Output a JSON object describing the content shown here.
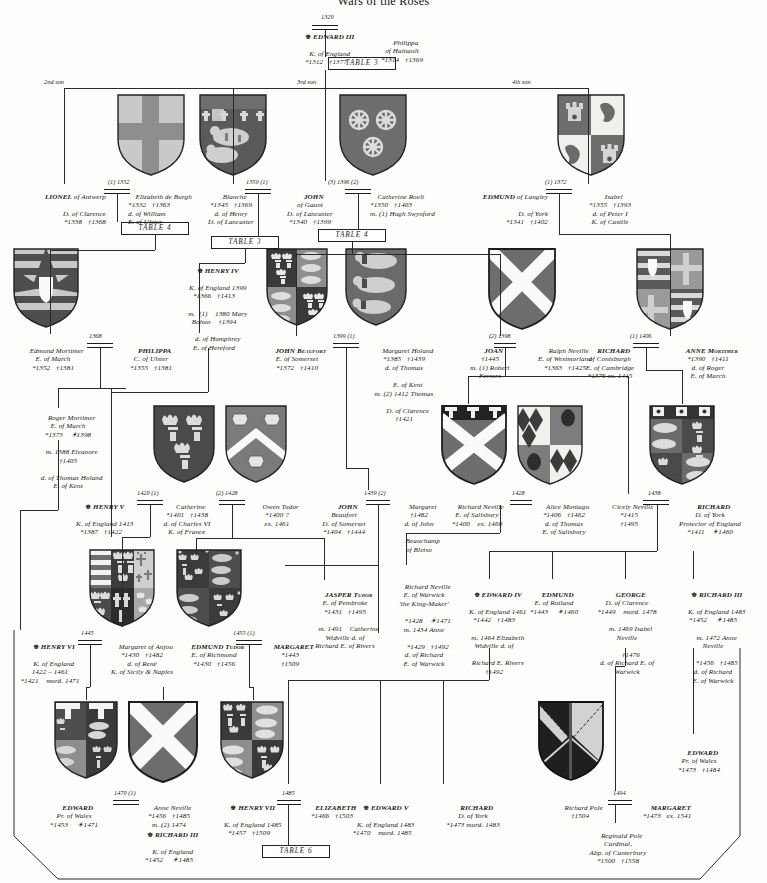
{
  "title": "Wars of the Roses",
  "generation_labels": [
    {
      "id": "second-son",
      "label": "2nd son"
    },
    {
      "id": "third-son",
      "label": "3rd son"
    },
    {
      "id": "fourth-son",
      "label": "4th son"
    }
  ],
  "table_refs": [
    {
      "id": "table-3-top",
      "label": "TABLE 3"
    },
    {
      "id": "table-4-lionel",
      "label": "TABLE 4"
    },
    {
      "id": "table-3-blanche",
      "label": "TABLE 3"
    },
    {
      "id": "table-4-gaunt",
      "label": "TABLE 4"
    },
    {
      "id": "table-6-bottom",
      "label": "TABLE 6"
    }
  ],
  "marriage_labels": [
    {
      "id": "m-edward3",
      "label": "1329"
    },
    {
      "id": "m-lionel",
      "label": "(1) 1352"
    },
    {
      "id": "m-blanche-gaunt",
      "label": "1359 (1)"
    },
    {
      "id": "m-gaunt-roelt",
      "label": "(3) 1396 (2)"
    },
    {
      "id": "m-edmund-isabel",
      "label": "(1) 1372"
    },
    {
      "id": "m-mortimer-philippa",
      "label": "1368"
    },
    {
      "id": "m-beaufort-holand",
      "label": "1399 (1)"
    },
    {
      "id": "m-joan-neville",
      "label": "(2) 1398"
    },
    {
      "id": "m-richard-anne",
      "label": "(1) 1406"
    },
    {
      "id": "m-henry5-catherine",
      "label": "1420 (1)"
    },
    {
      "id": "m-catherine-owen",
      "label": "(2) 1428"
    },
    {
      "id": "m-john-margaret",
      "label": "1439 (2)"
    },
    {
      "id": "m-neville-montagu",
      "label": "1428"
    },
    {
      "id": "m-cicely-richard",
      "label": "1438"
    },
    {
      "id": "m-henry6-margaret",
      "label": "1445"
    },
    {
      "id": "m-edmund-margaret",
      "label": "1455 (1)"
    },
    {
      "id": "m-edward-anne",
      "label": "1470 (1)"
    },
    {
      "id": "m-henry7-elizabeth",
      "label": "1485"
    },
    {
      "id": "m-pole-margaret",
      "label": "1494"
    }
  ],
  "people": [
    {
      "id": "edward-iii",
      "crown": true,
      "name": "EDWARD III",
      "lines": [
        "K. of England",
        "*1312   †1377"
      ]
    },
    {
      "id": "philippa-hainault",
      "crown": false,
      "name": "Philippa",
      "lines": [
        "of Hainault",
        "*1314   †1369"
      ]
    },
    {
      "id": "lionel-antwerp",
      "crown": false,
      "name": "LIONEL",
      "name_suffix": " of Antwerp",
      "lines": [
        "D. of Clarence",
        "*1338   †1368"
      ]
    },
    {
      "id": "elizabeth-de-burgh",
      "crown": false,
      "name": "Elizabeth de Burgh",
      "lines": [
        "*1332   †1363",
        "d. of William",
        "E. of Ulster"
      ]
    },
    {
      "id": "blanche",
      "crown": false,
      "name": "Blanche",
      "lines": [
        "*1345   †1369",
        "d. of Henry",
        "D. of Lancaster"
      ]
    },
    {
      "id": "john-gaunt",
      "crown": false,
      "name": "JOHN",
      "lines": [
        "of Gaunt",
        "D. of Lancaster",
        "*1340   †1399"
      ]
    },
    {
      "id": "catherine-roelt",
      "crown": false,
      "name": "Catherine Roelt",
      "lines": [
        "*1350   †1403",
        "m. (1) Hugh Swynford"
      ]
    },
    {
      "id": "edmund-langley",
      "crown": false,
      "name": "EDMUND",
      "name_suffix": " of Langley",
      "lines": [
        "D. of York",
        "*1341   †1402"
      ]
    },
    {
      "id": "isabel-castile",
      "crown": false,
      "name": "Isabel",
      "lines": [
        "*1355   †1393",
        "d. of Peter I",
        "K. of Castile"
      ]
    },
    {
      "id": "edmund-mortimer",
      "crown": false,
      "name": "Edmund Mortimer",
      "lines": [
        "E. of March",
        "*1352   †1381"
      ]
    },
    {
      "id": "philippa-ulster",
      "crown": false,
      "name": "PHILIPPA",
      "lines": [
        "C. of Ulster",
        "*1355   †1381"
      ]
    },
    {
      "id": "henry-iv",
      "crown": true,
      "name": "HENRY IV",
      "lines": [
        "K. of England 1399",
        "*1366   †1413",
        "m.  (1)    1380 Mary",
        "Bohun    †1394",
        "d. of Humphrey",
        "E. of Hereford"
      ]
    },
    {
      "id": "john-beaufort",
      "crown": false,
      "name": "JOHN Beaufort",
      "lines": [
        "E. of Somerset",
        "*1372   †1410"
      ]
    },
    {
      "id": "margaret-holand",
      "crown": false,
      "name": "Margaret Holand",
      "lines": [
        "*1385   †1439",
        "d. of Thomas",
        "E. of Kent",
        "m. (2) 1412 Thomas",
        "D. of Clarence",
        "†1421"
      ]
    },
    {
      "id": "joan",
      "crown": false,
      "name": "JOAN",
      "lines": [
        "†1445",
        "m. (1) Robert",
        "Ferrers"
      ]
    },
    {
      "id": "ralph-neville",
      "crown": false,
      "name": "Ralph Neville",
      "lines": [
        "E. of Westmorland",
        "*1363   †1425"
      ]
    },
    {
      "id": "richard-conisburgh",
      "crown": false,
      "name": "RICHARD",
      "lines": [
        "of Conisburgh",
        "E. of Cambridge",
        "*1376 ex. 1415"
      ]
    },
    {
      "id": "anne-mortimer",
      "crown": false,
      "name": "ANNE Mortimer",
      "lines": [
        "*1390   †1411",
        "d. of Roger",
        "E. of March"
      ]
    },
    {
      "id": "roger-mortimer",
      "crown": false,
      "name": "Roger Mortimer",
      "lines": [
        "E. of March",
        "*1373    ☀1398",
        "m. 1388 Eleanore",
        "†1405",
        "d. of Thomas Holand",
        "E. of Kent"
      ]
    },
    {
      "id": "henry-v",
      "crown": true,
      "name": "HENRY V",
      "lines": [
        "K. of England 1413",
        "*1387   †1422"
      ]
    },
    {
      "id": "catherine-valois",
      "crown": false,
      "name": "Catherine",
      "lines": [
        "*1401   †1438",
        "d. of Charles VI",
        "K. of France"
      ]
    },
    {
      "id": "owen-tudor",
      "crown": false,
      "name": "Owen Tudor",
      "lines": [
        "*1400 ?",
        "ex. 1461"
      ]
    },
    {
      "id": "john-beaufort-2",
      "crown": false,
      "name": "JOHN",
      "lines": [
        "Beaufort",
        "D. of Somerset",
        "*1404   †1444"
      ]
    },
    {
      "id": "margaret-beauchamp",
      "crown": false,
      "name": "Margaret",
      "lines": [
        "†1482",
        "d. of John",
        "Beauchamp",
        "of Bletso"
      ]
    },
    {
      "id": "richard-neville-salisbury",
      "crown": false,
      "name": "Richard Neville",
      "lines": [
        "E. of Salisbury",
        "*1400    ex. 1460"
      ]
    },
    {
      "id": "alice-montagu",
      "crown": false,
      "name": "Alice Montagu",
      "lines": [
        "*1406   †1462",
        "d. of Thomas",
        "E. of Salisbury"
      ]
    },
    {
      "id": "cicely-neville",
      "crown": false,
      "name": "Cicely Neville",
      "lines": [
        "*1415",
        "†1495"
      ]
    },
    {
      "id": "richard-york",
      "crown": false,
      "name": "RICHARD",
      "lines": [
        "D. of York",
        "Protector of England",
        "*1411    ☀1460"
      ]
    },
    {
      "id": "jasper-tudor",
      "crown": false,
      "name": "JASPER Tudor",
      "lines": [
        "E. of Pembroke",
        "*1431   †1495",
        "m. 1491    Catherine",
        "Widville d. of",
        "Richard E. of Rivers"
      ]
    },
    {
      "id": "richard-neville-warwick",
      "crown": false,
      "name": "Richard Neville",
      "lines": [
        "E. of Warwick",
        "'the King-Maker'",
        "*1428    ☀1471",
        "m. 1434 Anne",
        "*1429   †1492",
        "d. of Richard",
        "E. of Warwick"
      ]
    },
    {
      "id": "edward-iv",
      "crown": true,
      "name": "EDWARD IV",
      "lines": [
        "K. of England 1461",
        "*1442   †1483",
        "m. 1464 Elizabeth",
        "Widville d. of",
        "Richard E. Rivers",
        "†1492"
      ]
    },
    {
      "id": "edmund-rutland",
      "crown": false,
      "name": "EDMUND",
      "lines": [
        "E. of Rutland",
        "*1443     ☀1460"
      ]
    },
    {
      "id": "george-clarence",
      "crown": false,
      "name": "GEORGE",
      "lines": [
        "D. of Clarence",
        "*1449    murd. 1478",
        "m. 1469 Isabel",
        "Neville",
        "†1476",
        "d. of Richard E. of",
        "Warwick"
      ]
    },
    {
      "id": "richard-iii-top",
      "crown": true,
      "name": "RICHARD III",
      "lines": [
        "K. of England 1483",
        "*1452     ☀1485",
        "m. 1472 Anne",
        "Neville",
        "*1456   †1485",
        "d. of Richard",
        "E. of Warwick"
      ]
    },
    {
      "id": "henry-vi",
      "crown": true,
      "name": "HENRY VI",
      "lines": [
        "K. of England",
        "1422 – 1461",
        "*1421    murd. 1471"
      ]
    },
    {
      "id": "margaret-anjou",
      "crown": false,
      "name": "Margaret of Anjou",
      "lines": [
        "*1430   †1482",
        "d. of René",
        "K. of Sicily & Naples"
      ]
    },
    {
      "id": "edmund-tudor",
      "crown": false,
      "name": "EDMUND Tudor",
      "lines": [
        "E. of Richmond",
        "*1430   †1456"
      ]
    },
    {
      "id": "margaret-beaufort",
      "crown": false,
      "name": "MARGARET",
      "lines": [
        "*1443",
        "†1509"
      ]
    },
    {
      "id": "edward-pr-wales-1471",
      "crown": false,
      "name": "EDWARD",
      "lines": [
        "Pr. of Wales",
        "*1453     ☀1471"
      ]
    },
    {
      "id": "anne-neville",
      "crown": false,
      "name": "Anne Neville",
      "lines": [
        "*1456   †1485",
        "m. (2) 1474"
      ]
    },
    {
      "id": "richard-iii-bottom",
      "crown": true,
      "name": "RICHARD III",
      "lines": [
        "K. of England",
        "*1452     ☀1485"
      ]
    },
    {
      "id": "henry-vii",
      "crown": true,
      "name": "HENRY VII",
      "lines": [
        "K. of England 1485",
        "*1457   †1509"
      ]
    },
    {
      "id": "elizabeth-york",
      "crown": false,
      "name": "ELIZABETH",
      "lines": [
        "*1466   †1503"
      ]
    },
    {
      "id": "edward-v",
      "crown": true,
      "name": "EDWARD V",
      "lines": [
        "K. of England 1483",
        "*1470    murd. 1485"
      ]
    },
    {
      "id": "richard-york-duke",
      "crown": false,
      "name": "RICHARD",
      "lines": [
        "D. of York",
        "*1473 murd. 1483"
      ]
    },
    {
      "id": "edward-pr-wales-1484",
      "crown": false,
      "name": "EDWARD",
      "lines": [
        "Pr. of Wales",
        "*1473   †1484"
      ]
    },
    {
      "id": "richard-pole",
      "crown": false,
      "name": "Richard Pole",
      "lines": [
        "†1504"
      ]
    },
    {
      "id": "margaret-pole",
      "crown": false,
      "name": "MARGARET",
      "lines": [
        "*1473   ex. 1541"
      ]
    },
    {
      "id": "reginald-pole",
      "crown": false,
      "name": "Reginald Pole",
      "lines": [
        "Cardinal,",
        "Abp. of Canterbury",
        "*1500   †1558"
      ]
    }
  ],
  "shields": [
    {
      "id": "shield-lionel-clarence",
      "blazon": "clarence-cross"
    },
    {
      "id": "shield-blanche-lancaster",
      "blazon": "lancaster-lions"
    },
    {
      "id": "shield-john-gaunt",
      "blazon": "roelt-wheels"
    },
    {
      "id": "shield-isabel-castile",
      "blazon": "castile-leon"
    },
    {
      "id": "shield-edmund-mortimer",
      "blazon": "mortimer-bars"
    },
    {
      "id": "shield-john-beaufort",
      "blazon": "beaufort-quartered"
    },
    {
      "id": "shield-margaret-holand",
      "blazon": "holand-lions"
    },
    {
      "id": "shield-ralph-neville",
      "blazon": "neville-saltire"
    },
    {
      "id": "shield-richard-conisburgh",
      "blazon": "cambridge-quartered"
    },
    {
      "id": "shield-catherine-valois",
      "blazon": "france-fleurs"
    },
    {
      "id": "shield-owen-tudor",
      "blazon": "tudor-chevron-helms"
    },
    {
      "id": "shield-neville-salisbury",
      "blazon": "salisbury-quartered"
    },
    {
      "id": "shield-alice-montagu",
      "blazon": "montagu-eagle"
    },
    {
      "id": "shield-richard-york",
      "blazon": "york-quartered"
    },
    {
      "id": "shield-henry-vi",
      "blazon": "henry6-quartered"
    },
    {
      "id": "shield-margaret-anjou",
      "blazon": "anjou-quartered"
    },
    {
      "id": "shield-edward-pr-wales",
      "blazon": "wales-quartered"
    },
    {
      "id": "shield-anne-neville",
      "blazon": "neville-saltire"
    },
    {
      "id": "shield-henry-vii",
      "blazon": "tudor-quartered"
    },
    {
      "id": "shield-richard-pole",
      "blazon": "pole-saltire-engrailed"
    }
  ],
  "colors": {
    "ink": "#2a2a2a",
    "paper": "#fdfdfb",
    "tincture_dark": "#4a4a4a",
    "tincture_mid": "#8e8e8e",
    "tincture_light": "#c9c9c9",
    "tincture_white": "#f2f2ee",
    "tincture_black": "#1f1f1f"
  }
}
